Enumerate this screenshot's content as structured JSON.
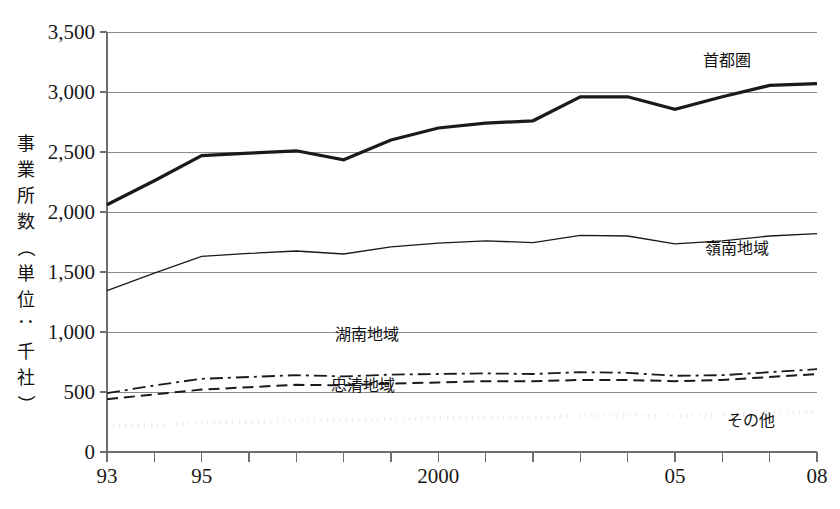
{
  "chart_data": {
    "type": "line",
    "title": "",
    "subtitle": "",
    "xlabel": "",
    "ylabel": "事業所数（単位：千社）",
    "ylabel_chars": [
      "事",
      "業",
      "所",
      "数",
      "（",
      "単",
      "位",
      "：",
      "千",
      "社",
      "）"
    ],
    "x": [
      1993,
      1994,
      1995,
      1996,
      1997,
      1998,
      1999,
      2000,
      2001,
      2002,
      2003,
      2004,
      2005,
      2006,
      2007,
      2008
    ],
    "xtick_labels": [
      {
        "year": 1993,
        "label": "93"
      },
      {
        "year": 1995,
        "label": "95"
      },
      {
        "year": 2000,
        "label": "2000"
      },
      {
        "year": 2005,
        "label": "05"
      },
      {
        "year": 2008,
        "label": "08"
      }
    ],
    "ytick_labels": [
      "3,500",
      "3,000",
      "2,500",
      "2,000",
      "1,500",
      "1,000",
      "500",
      "0"
    ],
    "ytick_values": [
      3500,
      3000,
      2500,
      2000,
      1500,
      1000,
      500,
      0
    ],
    "ylim": [
      0,
      3500
    ],
    "xlim": [
      1993,
      2008
    ],
    "grid": "horizontal",
    "legend_position": "inline-labels",
    "series": [
      {
        "name": "首都圏",
        "label": "首都圏",
        "style": "solid",
        "width": 3.2,
        "color": "#1a1a1a",
        "label_x": 2006.1,
        "label_y": 3220,
        "values": [
          2060,
          2260,
          2470,
          2490,
          2510,
          2435,
          2600,
          2700,
          2740,
          2760,
          2960,
          2960,
          2855,
          2960,
          3055,
          3070
        ]
      },
      {
        "name": "嶺南地域",
        "label": "嶺南地域",
        "style": "solid",
        "width": 1.3,
        "color": "#1a1a1a",
        "label_x": 2006.3,
        "label_y": 1650,
        "values": [
          1345,
          1490,
          1630,
          1655,
          1675,
          1650,
          1710,
          1740,
          1760,
          1745,
          1805,
          1800,
          1735,
          1760,
          1800,
          1820
        ]
      },
      {
        "name": "湖南地域",
        "label": "湖南地域",
        "style": "dashdot",
        "width": 1.8,
        "color": "#1a1a1a",
        "label_x": 1998.5,
        "label_y": 930,
        "values": [
          490,
          555,
          610,
          625,
          640,
          630,
          645,
          650,
          655,
          650,
          665,
          660,
          635,
          640,
          665,
          690
        ]
      },
      {
        "name": "忠清地域",
        "label": "忠清地域",
        "style": "dashed",
        "width": 2.0,
        "color": "#1a1a1a",
        "label_x": 1998.4,
        "label_y": 510,
        "values": [
          440,
          480,
          520,
          540,
          560,
          555,
          570,
          580,
          590,
          590,
          600,
          600,
          590,
          600,
          625,
          650
        ]
      },
      {
        "name": "その他",
        "label": "その他",
        "style": "dotted",
        "width": 4.0,
        "color": "#1a1a1a",
        "label_x": 2006.6,
        "label_y": 215,
        "values": [
          210,
          225,
          240,
          250,
          260,
          265,
          275,
          280,
          285,
          290,
          300,
          305,
          300,
          305,
          320,
          335
        ]
      }
    ]
  }
}
